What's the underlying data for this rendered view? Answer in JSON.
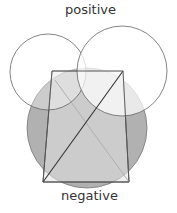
{
  "diagram": {
    "labels": {
      "top": "positive",
      "bottom": "negative"
    },
    "shapes": {
      "left_circle": {
        "cx": 48,
        "cy": 72,
        "r": 38,
        "fill": "none",
        "stroke": "#555555"
      },
      "right_circle": {
        "cx": 122,
        "cy": 71,
        "r": 45,
        "fill": "#ffffff",
        "stroke": "#555555"
      },
      "gray_circle": {
        "cx": 87,
        "cy": 128,
        "r": 60,
        "fill": "#9a9a9a"
      },
      "quadrilateral": {
        "points": [
          [
            52,
            71
          ],
          [
            123,
            71
          ],
          [
            129,
            182
          ],
          [
            43,
            182
          ]
        ],
        "fill": "#d8d8d8",
        "stroke": "#444444"
      },
      "dark_diagonal": {
        "from": [
          43,
          182
        ],
        "to": [
          123,
          71
        ],
        "stroke": "#333333"
      },
      "light_diagonal": {
        "from": [
          55,
          80
        ],
        "to": [
          129,
          182
        ],
        "stroke": "#aaaaaa"
      }
    }
  }
}
